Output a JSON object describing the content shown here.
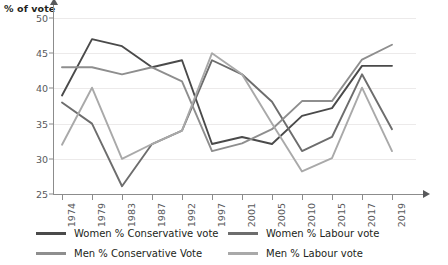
{
  "chart_data": {
    "type": "line",
    "title": "",
    "subtitle": "",
    "xlabel": "",
    "ylabel": "% of vote",
    "categories": [
      "1974",
      "1979",
      "1983",
      "1987",
      "1992",
      "1997",
      "2001",
      "2005",
      "2010",
      "2015",
      "2017",
      "2019"
    ],
    "ylim": [
      25,
      50
    ],
    "yticks": [
      25,
      30,
      35,
      40,
      45,
      50
    ],
    "grid": true,
    "legend_position": "bottom",
    "series": [
      {
        "name": "Women % Conservative vote",
        "color": "#4a4a4a",
        "values": [
          39.0,
          47.0,
          46.0,
          43.0,
          44.0,
          32.1,
          33.1,
          32.1,
          36.1,
          37.2,
          43.2,
          43.2
        ]
      },
      {
        "name": "Women % Labour vote",
        "color": "#6d6d6d",
        "values": [
          38.0,
          35.0,
          26.1,
          32.1,
          34.0,
          44.0,
          42.0,
          38.1,
          31.1,
          33.1,
          42.0,
          34.2
        ]
      },
      {
        "name": "Men % Conservative Vote",
        "color": "#8e8e8e",
        "values": [
          43.0,
          43.0,
          42.0,
          43.0,
          41.0,
          31.1,
          32.2,
          34.2,
          38.2,
          38.2,
          44.1,
          46.2
        ]
      },
      {
        "name": "Men % Labour vote",
        "color": "#a9a9a9",
        "values": [
          32.0,
          40.1,
          30.0,
          32.1,
          34.0,
          45.0,
          42.0,
          35.0,
          28.2,
          30.1,
          40.1,
          31.1
        ]
      }
    ]
  },
  "axis": {
    "y_title": "% of vote"
  },
  "legend": {
    "items": [
      {
        "label": "Women % Conservative vote",
        "color": "#4a4a4a"
      },
      {
        "label": "Women % Labour vote",
        "color": "#6d6d6d"
      },
      {
        "label": "Men % Conservative Vote",
        "color": "#8e8e8e"
      },
      {
        "label": "Men % Labour vote",
        "color": "#a9a9a9"
      }
    ]
  }
}
